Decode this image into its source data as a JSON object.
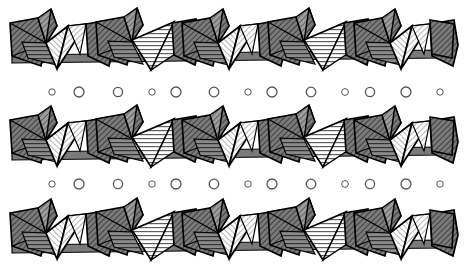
{
  "figure": {
    "width": 464,
    "height": 277,
    "background_color": "#ffffff"
  },
  "style": {
    "outline_color": "#000000",
    "outline_width": 1.6,
    "inner_line_color": "#000000",
    "inner_line_width": 1.1,
    "dark_face_color": "#7a7a7a",
    "mid_face_color": "#a6a6a6",
    "light_face_color": "#f2f2f2",
    "white_face_color": "#ffffff",
    "hatch_dark_color": "#3a3a3a",
    "hatch_light_color": "#555555",
    "circle_stroke_color": "#555555",
    "circle_fill_color": "#ffffff"
  },
  "chains": [
    {
      "name": "chain-top",
      "y_offset": 6,
      "repeat_count": 5,
      "repeat_period": 86,
      "x_start": 12
    },
    {
      "name": "chain-middle",
      "y_offset": 103,
      "repeat_count": 5,
      "repeat_period": 86,
      "x_start": 12
    },
    {
      "name": "chain-bottom",
      "y_offset": 196,
      "repeat_count": 5,
      "repeat_period": 86,
      "x_start": 12
    }
  ],
  "circle_rows": [
    {
      "name": "circle-row-upper",
      "y": 92,
      "circles": [
        {
          "cx": 52,
          "r": 3.2
        },
        {
          "cx": 79,
          "r": 5.0
        },
        {
          "cx": 118,
          "r": 4.6
        },
        {
          "cx": 152,
          "r": 3.2
        },
        {
          "cx": 176,
          "r": 5.0
        },
        {
          "cx": 214,
          "r": 4.8
        },
        {
          "cx": 248,
          "r": 3.2
        },
        {
          "cx": 272,
          "r": 5.0
        },
        {
          "cx": 311,
          "r": 4.8
        },
        {
          "cx": 345,
          "r": 3.4
        },
        {
          "cx": 370,
          "r": 4.6
        },
        {
          "cx": 406,
          "r": 5.0
        },
        {
          "cx": 440,
          "r": 3.2
        }
      ]
    },
    {
      "name": "circle-row-lower",
      "y": 184,
      "circles": [
        {
          "cx": 52,
          "r": 3.2
        },
        {
          "cx": 79,
          "r": 5.0
        },
        {
          "cx": 118,
          "r": 4.6
        },
        {
          "cx": 152,
          "r": 3.2
        },
        {
          "cx": 176,
          "r": 5.0
        },
        {
          "cx": 214,
          "r": 4.8
        },
        {
          "cx": 248,
          "r": 3.2
        },
        {
          "cx": 272,
          "r": 5.0
        },
        {
          "cx": 311,
          "r": 4.8
        },
        {
          "cx": 345,
          "r": 3.4
        },
        {
          "cx": 370,
          "r": 4.6
        },
        {
          "cx": 406,
          "r": 5.0
        },
        {
          "cx": 440,
          "r": 3.2
        }
      ]
    }
  ],
  "polyhedra_unit": {
    "description": "One repeat period of the chain, coordinates relative to unit origin",
    "faces": [
      {
        "name": "left-dark-quad",
        "points": "0,12 26,8 34,34 30,56 2,46",
        "fill": "dark",
        "hatch": "diag-dark"
      },
      {
        "name": "left-dark-inner-tri",
        "points": "0,12 34,34 2,46",
        "fill": "dark",
        "hatch": "diag-dark"
      },
      {
        "name": "apex-small-tri",
        "points": "26,8 40,0 44,16 34,34",
        "fill": "mid",
        "hatch": "diag-mid"
      },
      {
        "name": "apex-spike-tri",
        "points": "34,34 40,0 44,16",
        "fill": "dark",
        "hatch": "diag-dark"
      },
      {
        "name": "down-tri-light-a",
        "points": "34,34 56,16 46,60",
        "fill": "light",
        "hatch": "diag-light"
      },
      {
        "name": "down-tri-light-b",
        "points": "46,60 56,16 74,14",
        "fill": "light",
        "hatch": "horiz-light"
      },
      {
        "name": "right-face-tri",
        "points": "56,16 74,14 70,44",
        "fill": "light",
        "hatch": "horiz-light"
      },
      {
        "name": "mid-band-quad",
        "points": "34,34 46,60 70,44 56,16",
        "fill": "light",
        "hatch": "diag-light"
      },
      {
        "name": "right-dark-quad",
        "points": "74,14 100,12 102,46 76,44",
        "fill": "dark",
        "hatch": "diag-dark"
      },
      {
        "name": "right-apex-tri",
        "points": "74,14 86,0 92,16",
        "fill": "mid",
        "hatch": "diag-mid"
      }
    ]
  },
  "legend": {
    "dark_polyhedra_label": "dark diagonally hatched polyhedra",
    "light_polyhedra_label": "light horizontally hatched polyhedra",
    "circle_label": "interlayer cation sites"
  }
}
